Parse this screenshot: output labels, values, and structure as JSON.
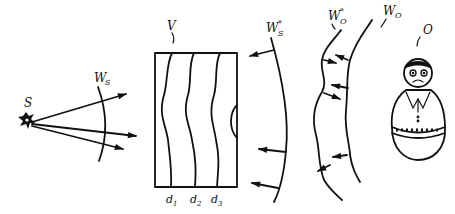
{
  "diagram": {
    "title": "",
    "labels": {
      "source": "S",
      "source_wavefront": "W",
      "source_wavefront_sub": "S",
      "volume": "V",
      "conj_source_wavefront": "W",
      "conj_source_wavefront_sup": "*",
      "conj_source_wavefront_sub": "S",
      "conj_object_wavefront": "W",
      "conj_object_wavefront_sup": "*",
      "conj_object_wavefront_sub": "O",
      "object_wavefront": "W",
      "object_wavefront_sub": "O",
      "object": "O",
      "layer_1": "d",
      "layer_1_sub": "1",
      "layer_2": "d",
      "layer_2_sub": "2",
      "layer_3": "d",
      "layer_3_sub": "3"
    },
    "colors": {
      "stroke": "#111111",
      "background": "#ffffff"
    }
  }
}
